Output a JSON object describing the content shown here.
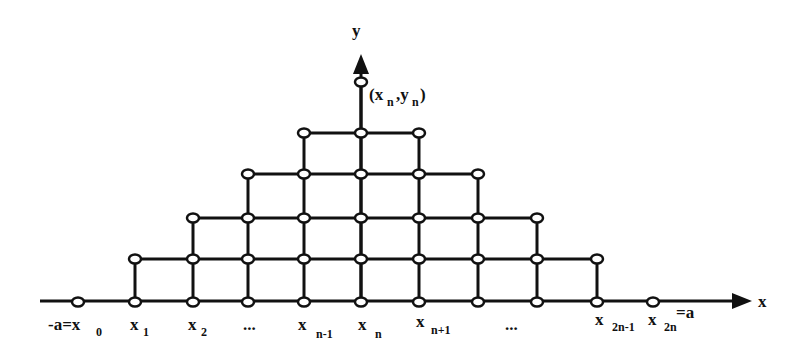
{
  "diagram": {
    "axes": {
      "x_label": "x",
      "y_label": "y",
      "top_point_label": {
        "main": "(x",
        "sub1": "n",
        "mid": ",y",
        "sub2": "n",
        "end": ")"
      }
    },
    "x_ticks": [
      {
        "main": "-a=x",
        "sub": "0",
        "sup": ""
      },
      {
        "main": "x",
        "sub": "1",
        "sup": ""
      },
      {
        "main": "x",
        "sub": "2",
        "sup": ""
      },
      {
        "main": "...",
        "sub": "",
        "sup": ""
      },
      {
        "main": "x",
        "sub": "n-1",
        "sup": ""
      },
      {
        "main": "x",
        "sub": "n",
        "sup": ""
      },
      {
        "main": "x",
        "sub": "n+1",
        "sup": ""
      },
      {
        "main": "...",
        "sub": "",
        "sup": ""
      },
      {
        "main": "x",
        "sub": "2n-1",
        "sup": ""
      },
      {
        "main": "x",
        "sub": "2n",
        "sup": "=a"
      }
    ],
    "columns_x": [
      78,
      135,
      193,
      248,
      304,
      361,
      419,
      478,
      537,
      597,
      653
    ],
    "rows_y": [
      302,
      259,
      218,
      174,
      133,
      82
    ],
    "column_heights": [
      0,
      1,
      2,
      3,
      4,
      5,
      4,
      3,
      2,
      1,
      0
    ],
    "colors": {
      "ink": "#111111",
      "background": "#ffffff"
    }
  }
}
